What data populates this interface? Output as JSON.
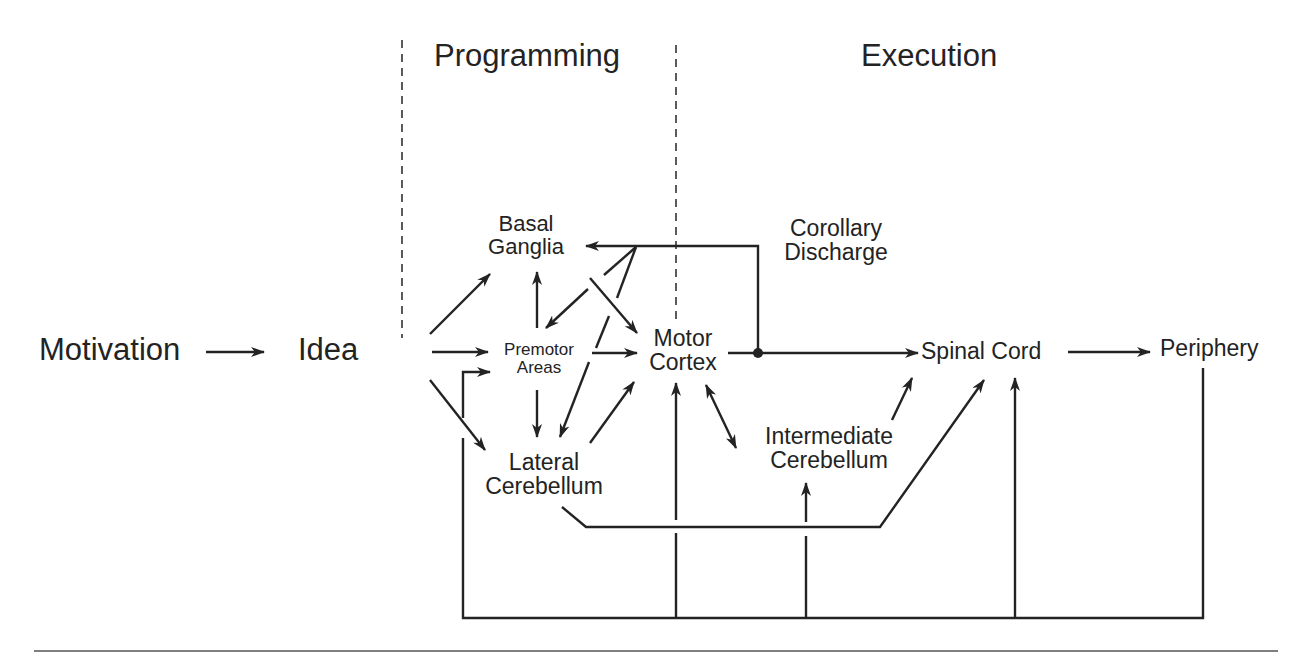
{
  "phases": {
    "programming": "Programming",
    "execution": "Execution"
  },
  "nodes": {
    "motivation": "Motivation",
    "idea": "Idea",
    "basal_ganglia": {
      "line1": "Basal",
      "line2": "Ganglia"
    },
    "premotor_areas": {
      "line1": "Premotor",
      "line2": "Areas"
    },
    "motor_cortex": {
      "line1": "Motor",
      "line2": "Cortex"
    },
    "lateral_cerebellum": {
      "line1": "Lateral",
      "line2": "Cerebellum"
    },
    "intermediate_cerebellum": {
      "line1": "Intermediate",
      "line2": "Cerebellum"
    },
    "spinal_cord": "Spinal Cord",
    "periphery": "Periphery",
    "corollary_discharge": {
      "line1": "Corollary",
      "line2": "Discharge"
    }
  },
  "edges": [
    {
      "from": "Motivation",
      "to": "Idea"
    },
    {
      "from": "Idea",
      "to": "Basal Ganglia"
    },
    {
      "from": "Idea",
      "to": "Premotor Areas"
    },
    {
      "from": "Idea",
      "to": "Lateral Cerebellum"
    },
    {
      "from": "Premotor Areas",
      "to": "Basal Ganglia"
    },
    {
      "from": "Premotor Areas",
      "to": "Lateral Cerebellum"
    },
    {
      "from": "Premotor Areas",
      "to": "Motor Cortex"
    },
    {
      "from": "Basal Ganglia",
      "to": "Motor Cortex"
    },
    {
      "from": "Lateral Cerebellum",
      "to": "Motor Cortex"
    },
    {
      "from": "Corollary Discharge",
      "to": "Basal Ganglia"
    },
    {
      "from": "Corollary Discharge",
      "to": "Premotor Areas"
    },
    {
      "from": "Corollary Discharge",
      "to": "Lateral Cerebellum"
    },
    {
      "from": "Motor Cortex",
      "to": "Spinal Cord"
    },
    {
      "from": "Motor Cortex",
      "to": "Intermediate Cerebellum",
      "bidirectional": true
    },
    {
      "from": "Intermediate Cerebellum",
      "to": "Spinal Cord"
    },
    {
      "from": "Lateral Cerebellum",
      "to": "Spinal Cord"
    },
    {
      "from": "Spinal Cord",
      "to": "Periphery"
    },
    {
      "from": "Periphery",
      "to": "Premotor Areas",
      "feedback": true
    },
    {
      "from": "Periphery",
      "to": "Motor Cortex",
      "feedback": true
    },
    {
      "from": "Periphery",
      "to": "Intermediate Cerebellum",
      "feedback": true
    },
    {
      "from": "Periphery",
      "to": "Spinal Cord",
      "feedback": true
    }
  ]
}
